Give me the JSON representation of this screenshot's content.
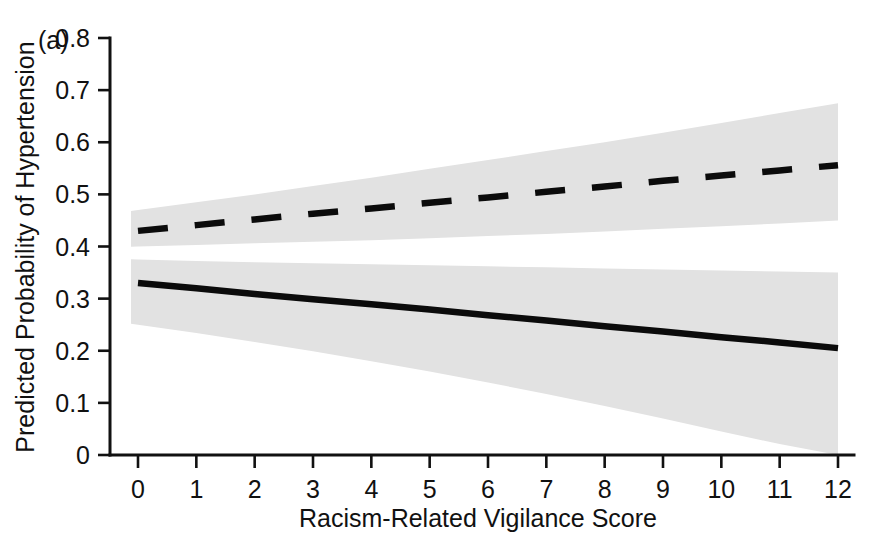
{
  "figure": {
    "panel_label": "(a)",
    "background_color": "#ffffff"
  },
  "chart_data": {
    "type": "line",
    "title": "",
    "xlabel": "Racism-Related Vigilance Score",
    "ylabel": "Predicted Probability of Hypertension",
    "xlim": [
      0,
      12
    ],
    "ylim": [
      0,
      0.8
    ],
    "grid": false,
    "legend_position": "none",
    "x_ticks": [
      0,
      1,
      2,
      3,
      4,
      5,
      6,
      7,
      8,
      9,
      10,
      11,
      12
    ],
    "x_tick_labels": [
      "0",
      "1",
      "2",
      "3",
      "4",
      "5",
      "6",
      "7",
      "8",
      "9",
      "10",
      "11",
      "12"
    ],
    "y_ticks": [
      0,
      0.1,
      0.2,
      0.3,
      0.4,
      0.5,
      0.6,
      0.7,
      0.8
    ],
    "y_tick_labels": [
      "0",
      "0.1",
      "0.2",
      "0.3",
      "0.4",
      "0.5",
      "0.6",
      "0.7",
      "0.8"
    ],
    "x": [
      0,
      1,
      2,
      3,
      4,
      5,
      6,
      7,
      8,
      9,
      10,
      11,
      12
    ],
    "series": [
      {
        "name": "Upper group (dashed)",
        "style": "dashed",
        "color": "#0b0b0b",
        "values": [
          0.43,
          0.441,
          0.452,
          0.463,
          0.473,
          0.484,
          0.494,
          0.505,
          0.515,
          0.526,
          0.536,
          0.546,
          0.556
        ],
        "ci_lower": [
          0.4,
          0.403,
          0.406,
          0.409,
          0.412,
          0.416,
          0.42,
          0.424,
          0.429,
          0.434,
          0.439,
          0.444,
          0.45
        ],
        "ci_upper": [
          0.47,
          0.485,
          0.5,
          0.516,
          0.532,
          0.549,
          0.566,
          0.583,
          0.6,
          0.618,
          0.637,
          0.656,
          0.675
        ]
      },
      {
        "name": "Lower group (solid)",
        "style": "solid",
        "color": "#0b0b0b",
        "values": [
          0.33,
          0.32,
          0.309,
          0.299,
          0.289,
          0.279,
          0.268,
          0.258,
          0.247,
          0.237,
          0.226,
          0.216,
          0.205
        ],
        "ci_lower": [
          0.25,
          0.234,
          0.217,
          0.199,
          0.18,
          0.16,
          0.139,
          0.117,
          0.094,
          0.07,
          0.045,
          0.021,
          0.0
        ],
        "ci_upper": [
          0.375,
          0.372,
          0.37,
          0.368,
          0.366,
          0.364,
          0.362,
          0.36,
          0.358,
          0.356,
          0.354,
          0.352,
          0.35
        ]
      }
    ],
    "band_fill_color": "#e2e2e2",
    "band_overlap_color": "#868686",
    "band_x_start": -0.12,
    "band_x_end": 12.0
  }
}
